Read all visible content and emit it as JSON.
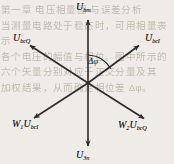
{
  "figure": {
    "type": "phasor-vector-diagram",
    "background_color": "#efece7",
    "stroke_color": "#2b2b2b",
    "origin": {
      "x": 88,
      "y": 83
    },
    "labels": {
      "top": {
        "symbol": "U",
        "subscript": "bm"
      },
      "bottom": {
        "symbol": "U",
        "subscript": "3n"
      },
      "upper_left": {
        "symbol": "U",
        "subscript": "bcQ"
      },
      "upper_right": {
        "symbol": "U",
        "subscript": "bcI"
      },
      "lower_left": {
        "prefix": "W",
        "prefix_subscript": "1",
        "symbol": "U",
        "subscript": "bcI"
      },
      "lower_right": {
        "prefix": "W",
        "prefix_subscript": "2",
        "symbol": "U",
        "subscript": "bcQ"
      },
      "angle": "Δφ"
    },
    "vectors": [
      {
        "name": "u-bm",
        "direction": "up",
        "tip": {
          "x": 88,
          "y": 18
        },
        "label": "U_bm"
      },
      {
        "name": "u-3n",
        "direction": "down",
        "tip": {
          "x": 88,
          "y": 148
        },
        "label": "U_3n"
      },
      {
        "name": "u-bcq",
        "direction": "upper-left",
        "tip": {
          "x": 28,
          "y": 44
        },
        "label": "U_bcQ"
      },
      {
        "name": "u-bci",
        "direction": "upper-right",
        "tip": {
          "x": 141,
          "y": 44
        },
        "label": "U_bcI"
      },
      {
        "name": "w1-u-bci",
        "direction": "lower-left",
        "tip": {
          "x": 32,
          "y": 119
        },
        "label": "W1 U_bcI"
      },
      {
        "name": "w2-u-bcq",
        "direction": "lower-right",
        "tip": {
          "x": 146,
          "y": 120
        },
        "label": "W2 U_bcQ"
      }
    ],
    "angle_arc": {
      "from_vector": "u-bm",
      "to_vector": "u-bci",
      "radius": 28,
      "label": "Δφ"
    }
  },
  "bleed_text": "第一章 电压相量图 与误差分析\n当测量电路处于稳态时，可用相量表示\n各个电压的幅值与相位。图中所示的\n六个矢量分别对应于正交分量及其\n加权结果，从而确定相位差 Δφ。"
}
